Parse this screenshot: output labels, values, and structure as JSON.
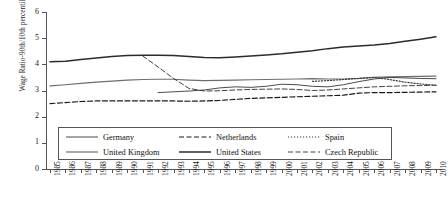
{
  "axes": {
    "ylabel": "Wage Ratio-90th/10th percentile",
    "xlabel": "",
    "ytick_labels": [
      "0",
      "1",
      "2",
      "3",
      "4",
      "5",
      "6"
    ]
  },
  "legend": {
    "rows": [
      [
        {
          "label": "Germany",
          "style": "solid-thin",
          "color": "#2b2b2b"
        },
        {
          "label": "Netherlands",
          "style": "dashed",
          "color": "#1a1a1a"
        },
        {
          "label": "Spain",
          "style": "dotted",
          "color": "#3a3a3a"
        }
      ],
      [
        {
          "label": "United Kingdom",
          "style": "solid-gray",
          "color": "#6e6e6e"
        },
        {
          "label": "United States",
          "style": "solid-thick",
          "color": "#2b2b2b"
        },
        {
          "label": "Czech Republic",
          "style": "dashdot",
          "color": "#2b2b2b"
        }
      ]
    ]
  },
  "chart_data": {
    "type": "line",
    "title": "",
    "xlabel": "",
    "ylabel": "Wage Ratio-90th/10th percentile",
    "ylim": [
      0,
      6
    ],
    "ytick_step": 1,
    "grid": false,
    "legend_position": "below-plot",
    "x": [
      1985,
      1986,
      1987,
      1988,
      1989,
      1990,
      1991,
      1992,
      1993,
      1994,
      1995,
      1996,
      1997,
      1998,
      1999,
      2000,
      2001,
      2002,
      2003,
      2004,
      2005,
      2006,
      2007,
      2008,
      2009,
      2010
    ],
    "series": [
      {
        "name": "United States",
        "style": "solid-thick",
        "color": "#2b2b2b",
        "values": [
          4.1,
          4.12,
          4.18,
          4.24,
          4.3,
          4.34,
          4.35,
          4.35,
          4.34,
          4.3,
          4.26,
          4.25,
          4.28,
          4.32,
          4.36,
          4.4,
          4.46,
          4.52,
          4.6,
          4.66,
          4.7,
          4.74,
          4.8,
          4.88,
          4.96,
          5.05
        ]
      },
      {
        "name": "United Kingdom",
        "style": "solid-gray",
        "color": "#6e6e6e",
        "values": [
          3.18,
          3.22,
          3.27,
          3.32,
          3.36,
          3.4,
          3.42,
          3.43,
          3.43,
          3.4,
          3.38,
          3.39,
          3.4,
          3.41,
          3.42,
          3.43,
          3.44,
          3.45,
          3.44,
          3.44,
          3.46,
          3.5,
          3.52,
          3.53,
          3.54,
          3.55
        ]
      },
      {
        "name": "Netherlands",
        "style": "dashed",
        "color": "#1a1a1a",
        "values": [
          2.5,
          2.54,
          2.58,
          2.6,
          2.6,
          2.6,
          2.6,
          2.6,
          2.6,
          2.59,
          2.6,
          2.62,
          2.66,
          2.7,
          2.72,
          2.74,
          2.76,
          2.78,
          2.8,
          2.82,
          2.9,
          2.92,
          2.92,
          2.93,
          2.94,
          2.95
        ]
      },
      {
        "name": "Czech Republic",
        "style": "dashdot",
        "color": "#2b2b2b",
        "values": [
          null,
          null,
          null,
          null,
          null,
          null,
          4.32,
          3.9,
          3.46,
          3.08,
          2.98,
          2.99,
          3.02,
          3.04,
          3.05,
          3.06,
          3.04,
          3.0,
          3.02,
          3.06,
          3.1,
          3.14,
          3.16,
          3.18,
          3.19,
          3.2
        ]
      },
      {
        "name": "Germany",
        "style": "solid-thin",
        "color": "#2b2b2b",
        "values": [
          null,
          null,
          null,
          null,
          null,
          null,
          null,
          2.92,
          2.95,
          2.98,
          3.02,
          3.1,
          3.14,
          3.12,
          3.16,
          3.24,
          3.22,
          3.16,
          3.14,
          3.22,
          3.34,
          3.44,
          3.5,
          3.48,
          3.46,
          3.45
        ]
      },
      {
        "name": "Spain",
        "style": "dotted",
        "color": "#3a3a3a",
        "values": [
          null,
          null,
          null,
          null,
          null,
          null,
          null,
          null,
          null,
          null,
          null,
          null,
          null,
          null,
          null,
          null,
          null,
          3.35,
          3.38,
          3.42,
          3.46,
          3.5,
          3.42,
          3.32,
          3.25,
          3.2
        ]
      }
    ]
  }
}
